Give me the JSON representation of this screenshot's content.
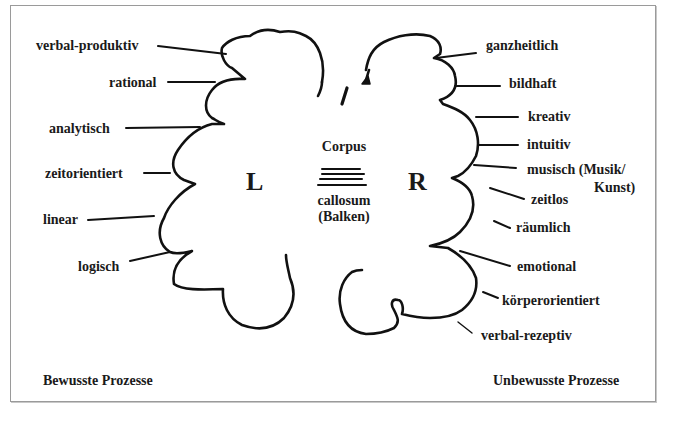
{
  "diagram": {
    "left_hemisphere": {
      "letter": "L",
      "labels": [
        "verbal-produktiv",
        "rational",
        "analytisch",
        "zeitorientiert",
        "linear",
        "logisch"
      ],
      "footer": "Bewusste Prozesse"
    },
    "right_hemisphere": {
      "letter": "R",
      "labels": [
        "ganzheitlich",
        "bildhaft",
        "kreativ",
        "intuitiv",
        "musisch (Musik/",
        "Kunst)",
        "zeitlos",
        "räumlich",
        "emotional",
        "körperorientiert",
        "verbal-rezeptiv"
      ],
      "footer": "Unbewusste Prozesse"
    },
    "corpus_callosum": {
      "line1": "Corpus",
      "line2": "callosum",
      "line3": "(Balken)"
    }
  }
}
